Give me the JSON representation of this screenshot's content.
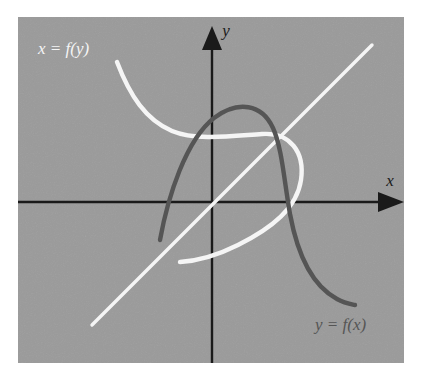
{
  "figure": {
    "background_color": "#ffffff",
    "panel": {
      "x": 18,
      "y": 17,
      "width": 386,
      "height": 346,
      "color": "#9a9a9a"
    }
  },
  "colors": {
    "panel_gray": "#9a9a9a",
    "axis_black": "#1a1a1a",
    "curve_dark": "#555555",
    "curve_white": "#f5f5f5",
    "label_white": "#f5f5f5",
    "label_dark": "#555555",
    "page_white": "#ffffff"
  },
  "axes": {
    "origin": {
      "x": 212,
      "y": 202
    },
    "x_axis": {
      "x1": 18,
      "y1": 202,
      "x2": 398,
      "y2": 202,
      "arrow": "right",
      "arrow_tip_x": 404
    },
    "y_axis": {
      "x1": 212,
      "y1": 363,
      "x2": 212,
      "y2": 37,
      "arrow": "up",
      "arrow_tip_y": 26
    },
    "stroke_width": 2.2,
    "labels": {
      "x": {
        "text": "x",
        "x": 390,
        "y": 186,
        "color": "#1a1a1a"
      },
      "y": {
        "text": "y",
        "x": 226,
        "y": 36,
        "color": "#1a1a1a"
      }
    }
  },
  "curves": [
    {
      "name": "y = f(x)",
      "role": "function",
      "color": "#555555",
      "stroke_width": 4.4,
      "path": "M 160 240 C 168 196, 186 140, 214 118 C 238 100, 262 104, 273 128 C 282 148, 284 180, 290 214 C 297 252, 311 285, 337 299 C 344 303, 350 304, 355 305",
      "label": {
        "text": "y = f(x)",
        "x": 315,
        "y": 330,
        "color": "#555555"
      }
    },
    {
      "name": "x = f(y)",
      "role": "inverse",
      "color": "#f5f5f5",
      "stroke_width": 4.4,
      "path": "M 117 62 C 130 96, 146 120, 172 131 C 196 141, 232 136, 262 134 C 290 132, 305 152, 301 180 C 297 208, 272 228, 238 245 C 214 257, 196 261, 180 262",
      "label": {
        "text": "x = f(y)",
        "x": 38,
        "y": 54,
        "color": "#f5f5f5"
      }
    },
    {
      "name": "y = x",
      "role": "reflection-line",
      "color": "#f5f5f5",
      "stroke_width": 3.4,
      "path": "M 92 325 L 372 45",
      "label": null
    }
  ],
  "labels": {
    "inverse_label": "x = f(y)",
    "function_label": "y = f(x)",
    "x_axis_label": "x",
    "y_axis_label": "y"
  },
  "chart_data": {
    "type": "line",
    "title": "",
    "xlabel": "x",
    "ylabel": "y",
    "grid": false,
    "legend": "inline-annotations",
    "annotations": [
      "x = f(y)",
      "y = f(x)"
    ],
    "series": [
      {
        "name": "y = f(x)",
        "color": "#555555",
        "points": [
          [
            160,
            240
          ],
          [
            172,
            210
          ],
          [
            188,
            170
          ],
          [
            206,
            132
          ],
          [
            226,
            113
          ],
          [
            248,
            104
          ],
          [
            266,
            114
          ],
          [
            274,
            136
          ],
          [
            280,
            168
          ],
          [
            288,
            206
          ],
          [
            297,
            250
          ],
          [
            312,
            284
          ],
          [
            334,
            298
          ],
          [
            355,
            305
          ]
        ]
      },
      {
        "name": "x = f(y)",
        "color": "#f5f5f5",
        "points": [
          [
            117,
            62
          ],
          [
            128,
            92
          ],
          [
            146,
            118
          ],
          [
            170,
            131
          ],
          [
            200,
            138
          ],
          [
            232,
            136
          ],
          [
            262,
            134
          ],
          [
            288,
            140
          ],
          [
            302,
            162
          ],
          [
            300,
            188
          ],
          [
            282,
            218
          ],
          [
            252,
            240
          ],
          [
            216,
            255
          ],
          [
            180,
            262
          ]
        ]
      },
      {
        "name": "y = x",
        "color": "#f5f5f5",
        "points": [
          [
            92,
            325
          ],
          [
            372,
            45
          ]
        ]
      }
    ]
  }
}
